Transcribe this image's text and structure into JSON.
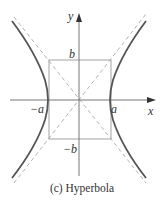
{
  "diagram": {
    "title": "Hyperbola",
    "caption": "(c) Hyperbola",
    "axes": {
      "x_label": "x",
      "y_label": "y"
    },
    "labels": {
      "a_pos": "a",
      "a_neg": "−a",
      "b_pos": "b",
      "b_neg": "−b"
    },
    "elements": {
      "curve": "hyperbola branches (left and right), solid dark gray",
      "asymptotes": "two dashed diagonal lines through origin",
      "box": "rectangle with corners (±a, ±b)"
    },
    "colors": {
      "curve": "#555555",
      "asymptote": "#aaaaaa",
      "axis": "#777777",
      "box": "#999999",
      "text": "#333333"
    }
  }
}
